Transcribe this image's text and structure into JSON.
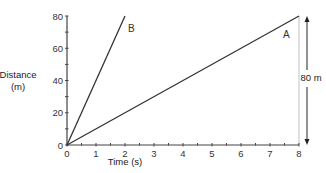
{
  "chart_data": {
    "type": "line",
    "title": "",
    "xlabel": "Time (s)",
    "ylabel": "Distance (m)",
    "ylabel_lines": [
      "Distance",
      "(m)"
    ],
    "xlim": [
      0,
      8
    ],
    "ylim": [
      0,
      80
    ],
    "x_ticks": [
      0,
      1,
      2,
      3,
      4,
      5,
      6,
      7,
      8
    ],
    "y_ticks": [
      0,
      20,
      40,
      60,
      80
    ],
    "grid": false,
    "series": [
      {
        "name": "A",
        "x": [
          0,
          8
        ],
        "y": [
          0,
          80
        ]
      },
      {
        "name": "B",
        "x": [
          0,
          2
        ],
        "y": [
          0,
          80
        ]
      }
    ],
    "annotations": [
      {
        "text": "80 m",
        "type": "double-arrow",
        "x": 8,
        "y_from": 0,
        "y_to": 80
      }
    ]
  },
  "labels": {
    "series_a": "A",
    "series_b": "B",
    "annotation": "80 m",
    "xlabel_prefix": "•˙",
    "xlabel": "Time (s)",
    "ylabel_line1": "Distance",
    "ylabel_line2": "(m)"
  },
  "colors": {
    "line": "#333333",
    "axis": "#444444",
    "guide": "#cccccc"
  }
}
